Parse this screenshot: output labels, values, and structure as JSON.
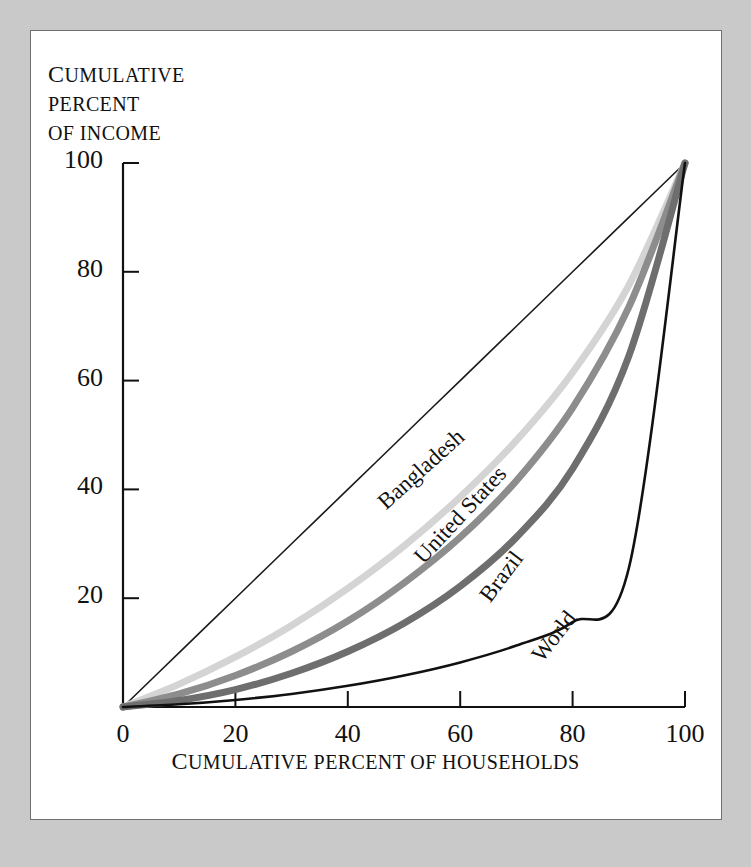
{
  "figure": {
    "background_color": "#c9c9c9",
    "panel_color": "#ffffff",
    "panel_border_color": "#6f6f6f"
  },
  "axis_titles": {
    "y_line1_cap": "C",
    "y_line1_rest": "UMULATIVE",
    "y_line2": "PERCENT",
    "y_line3": "OF INCOME",
    "x_cap": "C",
    "x_rest": "UMULATIVE PERCENT OF HOUSEHOLDS"
  },
  "chart_data": {
    "type": "line",
    "title": "",
    "subtitle": "",
    "xlabel": "CUMULATIVE PERCENT OF HOUSEHOLDS",
    "ylabel": "CUMULATIVE PERCENT OF INCOME",
    "xlim": [
      0,
      100
    ],
    "ylim": [
      0,
      100
    ],
    "grid": false,
    "legend_position": "inline-curve-labels",
    "xticks": [
      0,
      20,
      40,
      60,
      80,
      100
    ],
    "yticks": [
      20,
      40,
      60,
      80,
      100
    ],
    "xtick_labels": [
      "0",
      "20",
      "40",
      "60",
      "80",
      "100"
    ],
    "ytick_labels": [
      "20",
      "40",
      "60",
      "80",
      "100"
    ],
    "x": [
      0,
      10,
      20,
      30,
      40,
      50,
      60,
      70,
      80,
      90,
      100
    ],
    "series": [
      {
        "name": "line-of-equality",
        "label": "",
        "color": "#1a1a1a",
        "width": 1.6,
        "values": [
          0,
          10,
          20,
          30,
          40,
          50,
          60,
          70,
          80,
          90,
          100
        ]
      },
      {
        "name": "Bangladesh",
        "label": "Bangladesh",
        "color": "#d4d4d4",
        "width": 7,
        "values": [
          0,
          4.2,
          9.2,
          15.0,
          21.8,
          29.6,
          38.6,
          49.0,
          61.5,
          77.5,
          100
        ]
      },
      {
        "name": "United States",
        "label": "United States",
        "color": "#8d8d8d",
        "width": 7,
        "values": [
          0,
          2.4,
          5.8,
          10.2,
          15.8,
          22.8,
          31.2,
          41.6,
          55.0,
          73.5,
          100
        ]
      },
      {
        "name": "Brazil",
        "label": "Brazil",
        "color": "#6e6e6e",
        "width": 7,
        "values": [
          0,
          1.2,
          3.2,
          6.2,
          10.2,
          15.4,
          22.2,
          31.2,
          43.8,
          64.5,
          100
        ]
      },
      {
        "name": "World",
        "label": "World",
        "color": "#111111",
        "width": 2.6,
        "values": [
          0,
          0.5,
          1.3,
          2.4,
          3.9,
          5.8,
          8.2,
          11.3,
          15.6,
          25.5,
          100
        ]
      }
    ],
    "curve_labels": [
      {
        "text": "Bangladesh",
        "x_px": 390,
        "y_px": 489,
        "rotate": -42
      },
      {
        "text": "United States",
        "x_px": 428,
        "y_px": 543,
        "rotate": -47
      },
      {
        "text": "Brazil",
        "x_px": 495,
        "y_px": 581,
        "rotate": -53
      },
      {
        "text": "World",
        "x_px": 547,
        "y_px": 641,
        "rotate": -52
      }
    ]
  }
}
